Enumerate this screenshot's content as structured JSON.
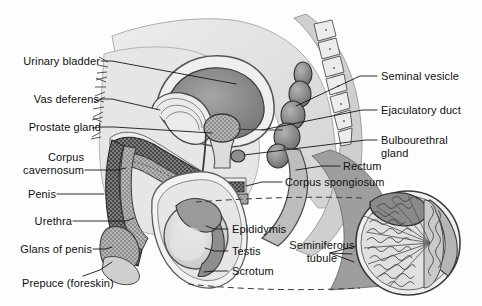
{
  "figure": {
    "style": "grayscale scanned textbook line illustration",
    "background_color": "#fdfdfd",
    "ink_color": "#101010",
    "width": 482,
    "height": 306
  },
  "labels": {
    "urinary_bladder": "Urinary bladder",
    "vas_deferens": "Vas deferens",
    "prostate_gland": "Prostate gland",
    "corpus_cavernosum_l1": "Corpus",
    "corpus_cavernosum_l2": "cavernosum",
    "penis": "Penis",
    "urethra": "Urethra",
    "glans_of_penis": "Glans of penis",
    "prepuce": "Prepuce (foreskin)",
    "seminal_vesicle": "Seminal vesicle",
    "ejaculatory_duct": "Ejaculatory duct",
    "bulbourethral_l1": "Bulbourethral",
    "bulbourethral_l2": "gland",
    "rectum": "Rectum",
    "corpus_spongiosum": "Corpus spongiosum",
    "epididymis": "Epididymis",
    "testis": "Testis",
    "seminiferous_l1": "Seminiferous",
    "seminiferous_l2": "tubule",
    "scrotum": "Scrotum"
  },
  "palette": {
    "tissue_light": "#e2e2e2",
    "tissue_mid": "#b9b9b9",
    "tissue_dark": "#8d8d8d",
    "tissue_darker": "#6e6e6e",
    "organ_shadow": "#787878",
    "outline": "#2a2a2a",
    "leader_line": "#1a1a1a",
    "dashed_line": "#3a3a3a",
    "cavernosum_fill": "#6a6a6a",
    "spongiosum_fill": "#9a9a9a"
  }
}
